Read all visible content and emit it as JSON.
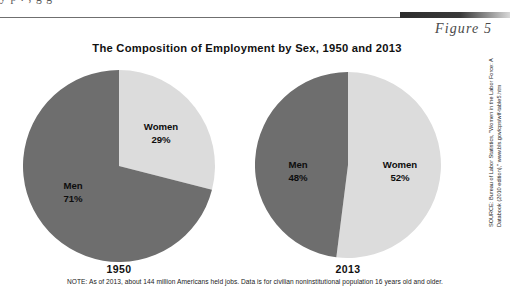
{
  "page": {
    "cut_off_line_above": "y  p  .  ,  g  g",
    "figure_label": "Figure 5",
    "title": "The Composition of Employment by Sex, 1950 and 2013",
    "note": "NOTE: As of 2013, about 144 million Americans held jobs. Data is for civilian noninstitutional population 16 years old and older.",
    "source_line1": "SOURCE: Bureau of Labor Statistics, \"Women in the Labor Force: A",
    "source_line2": "Databook (2010 edition),\" www.bls.gov/cps/wlf-table5.htm"
  },
  "colors": {
    "men": "#6e6e6e",
    "women": "#dcdcdc",
    "text": "#111111",
    "rule": "#6f6f6f"
  },
  "chart_data": [
    {
      "type": "pie",
      "title": "1950",
      "categories": [
        "Women",
        "Men"
      ],
      "values": [
        29,
        71
      ],
      "unit": "%",
      "labels": [
        {
          "name": "Women",
          "value": "29%"
        },
        {
          "name": "Men",
          "value": "71%"
        }
      ],
      "colors": [
        "#dcdcdc",
        "#6e6e6e"
      ],
      "start_angle_deg": 0,
      "direction": "clockwise",
      "legend": "none"
    },
    {
      "type": "pie",
      "title": "2013",
      "categories": [
        "Women",
        "Men"
      ],
      "values": [
        52,
        48
      ],
      "unit": "%",
      "labels": [
        {
          "name": "Women",
          "value": "52%"
        },
        {
          "name": "Men",
          "value": "48%"
        }
      ],
      "colors": [
        "#dcdcdc",
        "#6e6e6e"
      ],
      "start_angle_deg": 0,
      "direction": "clockwise",
      "legend": "none"
    }
  ],
  "pie_1950": {
    "women_name": "Women",
    "women_pct": "29%",
    "men_name": "Men",
    "men_pct": "71%",
    "year": "1950"
  },
  "pie_2013": {
    "women_name": "Women",
    "women_pct": "52%",
    "men_name": "Men",
    "men_pct": "48%",
    "year": "2013"
  }
}
